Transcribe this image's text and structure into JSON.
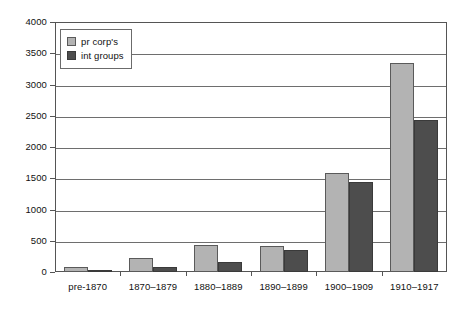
{
  "chart_data": {
    "type": "bar",
    "title": "",
    "subtitle": "",
    "xlabel": "",
    "ylabel": "",
    "ylim": [
      0,
      4000
    ],
    "ytick_step": 500,
    "yticks": [
      0,
      500,
      1000,
      1500,
      2000,
      2500,
      3000,
      3500,
      4000
    ],
    "ytick_labels": [
      "0",
      "500",
      "1000",
      "1500",
      "2000",
      "2500",
      "3000",
      "3500",
      "4000"
    ],
    "grid": "horizontal",
    "legend_position": "upper-left-inside",
    "categories": [
      "pre-1870",
      "1870–1879",
      "1880–1889",
      "1890–1899",
      "1900–1909",
      "1910–1917"
    ],
    "series": [
      {
        "name": "pr corp's",
        "color": "#b3b3b3",
        "values": [
          75,
          225,
          440,
          420,
          1580,
          3350
        ]
      },
      {
        "name": "int groups",
        "color": "#4d4d4d",
        "values": [
          40,
          85,
          165,
          350,
          1440,
          2430
        ]
      }
    ],
    "annotations": []
  },
  "legend": {
    "items": [
      {
        "label": "pr corp's",
        "swatch": "legend-swatch-light"
      },
      {
        "label": "int groups",
        "swatch": "legend-swatch-dark"
      }
    ]
  },
  "colors": {
    "series_light": "#b3b3b3",
    "series_dark": "#4d4d4d",
    "gridline": "#6e6e6e",
    "frame": "#555555",
    "text": "#111111",
    "background": "#ffffff"
  }
}
